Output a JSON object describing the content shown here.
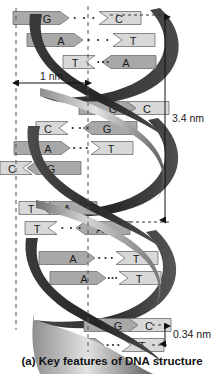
{
  "figure": {
    "caption": "(a) Key features of DNA structure"
  },
  "measurements": {
    "width_label": "1 nm",
    "height_label": "3.4 nm",
    "rise_label": "0.34 nm",
    "width_axis": "horizontal",
    "height_axis": "vertical",
    "rise_axis": "vertical"
  },
  "colors": {
    "ribbon_dark": "#3f3f3f",
    "ribbon_light": "#c9c9c9",
    "base_fill": "#a8a8a8",
    "base_fill_light": "#d8d8d8",
    "base_stroke": "#6e6e6e",
    "dashed_line": "#555555",
    "text": "#1a1a1a",
    "background": "#ffffff"
  },
  "guides": {
    "left_dashed_x": 16,
    "right_dashed_x": 88,
    "left_dashed_label": "left-helix-edge-guide",
    "right_dashed_label": "helix-axis-guide"
  },
  "base_pairs": [
    {
      "id": 1,
      "y": 18,
      "left_base": "G",
      "right_base": "C",
      "direction": "right",
      "left_x": 47,
      "right_x": 119,
      "hbonds": 3
    },
    {
      "id": 2,
      "y": 40,
      "left_base": "A",
      "right_base": "T",
      "direction": "right",
      "left_x": 61,
      "right_x": 133,
      "hbonds": 3
    },
    {
      "id": 3,
      "y": 62,
      "left_base": "T",
      "right_base": "A",
      "direction": "left",
      "left_x": 75,
      "right_x": 126,
      "hbonds": 3
    },
    {
      "id": 4,
      "y": 108,
      "left_base": "G",
      "right_base": "C",
      "direction": "right",
      "left_x": 113,
      "right_x": 147,
      "hbonds": 3
    },
    {
      "id": 5,
      "y": 128,
      "left_base": "C",
      "right_base": "G",
      "direction": "left",
      "left_x": 48,
      "right_x": 107,
      "hbonds": 3
    },
    {
      "id": 6,
      "y": 148,
      "left_base": "A",
      "right_base": "T",
      "direction": "right",
      "left_x": 48,
      "right_x": 111,
      "hbonds": 3
    },
    {
      "id": 7,
      "y": 168,
      "left_base": "C",
      "right_base": "G",
      "direction": "left",
      "left_x": 12,
      "right_x": 51,
      "hbonds": 3
    },
    {
      "id": 8,
      "y": 208,
      "left_base": "T",
      "right_base": "A",
      "direction": "left",
      "left_x": 31,
      "right_x": 67,
      "hbonds": 3
    },
    {
      "id": 9,
      "y": 228,
      "left_base": "T",
      "right_base": "A",
      "direction": "left",
      "left_x": 37,
      "right_x": 100,
      "hbonds": 3
    },
    {
      "id": 10,
      "y": 258,
      "left_base": "A",
      "right_base": "T",
      "direction": "right",
      "left_x": 73,
      "right_x": 136,
      "hbonds": 3
    },
    {
      "id": 11,
      "y": 278,
      "left_base": "A",
      "right_base": "T",
      "direction": "right",
      "left_x": 84,
      "right_x": 139,
      "hbonds": 3
    },
    {
      "id": 12,
      "y": 325,
      "left_base": "G",
      "right_base": "C",
      "direction": "right",
      "left_x": 118,
      "right_x": 149,
      "hbonds": 3
    },
    {
      "id": 13,
      "y": 345,
      "left_base": "A",
      "right_base": "T",
      "direction": "right",
      "left_x": 82,
      "right_x": 142,
      "hbonds": 3
    }
  ]
}
